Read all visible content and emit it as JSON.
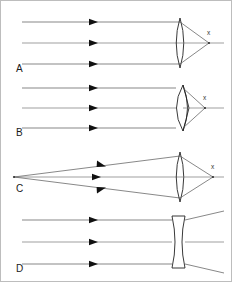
{
  "figure": {
    "width": 232,
    "height": 282,
    "background_color": "#ffffff",
    "border_color": "#bdbdbd",
    "ray_color": "#555555",
    "lens_color": "#222222",
    "label_color": "#1a1a1a"
  },
  "panels": [
    {
      "label": "A",
      "lens_type": "biconvex-converging",
      "incoming_rays": "parallel",
      "outgoing_rays": "converging",
      "focus_label": "x",
      "has_focus_point": true,
      "ray_count": 3,
      "arrow_count": 3
    },
    {
      "label": "B",
      "lens_type": "meniscus-converging",
      "incoming_rays": "parallel",
      "outgoing_rays": "converging",
      "focus_label": "x",
      "has_focus_point": true,
      "ray_count": 3,
      "arrow_count": 3
    },
    {
      "label": "C",
      "lens_type": "biconvex-converging",
      "incoming_rays": "diverging-from-point",
      "outgoing_rays": "converging",
      "focus_label": "x",
      "has_focus_point": true,
      "ray_count": 3,
      "arrow_count": 3
    },
    {
      "label": "D",
      "lens_type": "biconcave-diverging",
      "incoming_rays": "parallel",
      "outgoing_rays": "diverging",
      "focus_label": "",
      "has_focus_point": false,
      "ray_count": 3,
      "arrow_count": 3
    }
  ]
}
